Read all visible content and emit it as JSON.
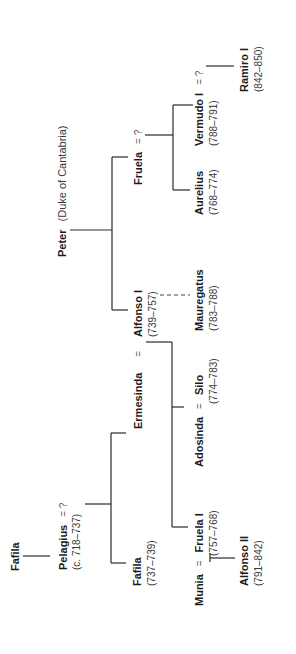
{
  "diagram": {
    "type": "family-tree",
    "orientation": "rotated-90-ccw",
    "colors": {
      "text": "#1c1c1c",
      "line": "#2a2a2a",
      "background": "#ffffff"
    },
    "people": {
      "fafila_elder": {
        "name": "Fafila"
      },
      "pelagius": {
        "name": "Pelagius",
        "spouse": "= ?",
        "dates": "(c. 718–737)"
      },
      "fafila": {
        "name": "Fafila",
        "dates": "(737–739)"
      },
      "ermesinda": {
        "name": "Ermesinda",
        "marriage": "="
      },
      "peter": {
        "name": "Peter",
        "title": "(Duke of Cantabria)"
      },
      "alfonso_i": {
        "name": "Alfonso I",
        "dates": "(739–757)"
      },
      "fruela": {
        "name": "Fruela",
        "spouse": "= ?"
      },
      "munia": {
        "name": "Munia",
        "marriage": "="
      },
      "fruela_i": {
        "name": "Fruela I",
        "dates": "(757–768)"
      },
      "adosinda": {
        "name": "Adosinda",
        "marriage": "="
      },
      "silo": {
        "name": "Silo",
        "dates": "(774–783)"
      },
      "mauregatus": {
        "name": "Mauregatus",
        "dates": "(783–788)"
      },
      "aurelius": {
        "name": "Aurelius",
        "dates": "(768–774)"
      },
      "vermudo_i": {
        "name": "Vermudo I",
        "spouse": "= ?",
        "dates": "(788–791)"
      },
      "alfonso_ii": {
        "name": "Alfonso II",
        "dates": "(791–842)"
      },
      "ramiro_i": {
        "name": "Ramiro I",
        "dates": "(842–850)"
      }
    },
    "relations": [
      {
        "from": "Fafila",
        "to": "Pelagius",
        "kind": "parent-child"
      },
      {
        "from": "Pelagius",
        "to": [
          "Fafila",
          "Ermesinda"
        ],
        "kind": "parent-children"
      },
      {
        "from": "Peter",
        "to": [
          "Alfonso I",
          "Fruela"
        ],
        "kind": "parent-children"
      },
      {
        "from": "Ermesinda = Alfonso I",
        "to": [
          "Fruela I",
          "Adosinda"
        ],
        "kind": "parent-children"
      },
      {
        "from": "Alfonso I",
        "to": "Mauregatus",
        "kind": "illegitimate"
      },
      {
        "from": "Fruela",
        "to": [
          "Aurelius",
          "Vermudo I"
        ],
        "kind": "parent-children"
      },
      {
        "from": "Munia = Fruela I",
        "to": "Alfonso II",
        "kind": "parent-child"
      },
      {
        "from": "Vermudo I",
        "to": "Ramiro I",
        "kind": "parent-child"
      }
    ]
  }
}
